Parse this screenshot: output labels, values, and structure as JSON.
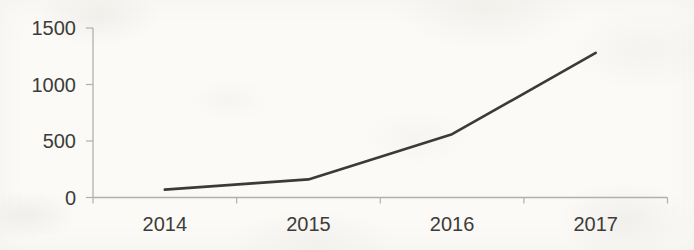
{
  "page": {
    "background": "#fbfaf7"
  },
  "chart_data": {
    "type": "line",
    "title": "",
    "categories": [
      "2014",
      "2015",
      "2016",
      "2017"
    ],
    "values": [
      70,
      160,
      560,
      1280
    ],
    "xlabel": "",
    "ylabel": "",
    "ylim": [
      0,
      1500
    ],
    "yticks": [
      0,
      500,
      1000,
      1500
    ],
    "grid": false,
    "legend": false,
    "line_color": "#3a3a3a",
    "axis_color": "#b2b0ac",
    "tick_label_color": "#3d3c3a",
    "tick_label_font_size": 20
  }
}
